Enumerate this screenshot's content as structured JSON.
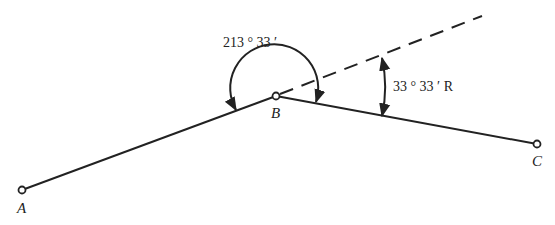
{
  "diagram": {
    "type": "traverse-deflection-angle",
    "points": [
      {
        "id": "A",
        "label": "A",
        "x": 22,
        "y": 190
      },
      {
        "id": "B",
        "label": "B",
        "x": 276,
        "y": 96
      },
      {
        "id": "C",
        "label": "C",
        "x": 537,
        "y": 144
      }
    ],
    "segments": [
      {
        "from": "A",
        "to": "B",
        "style": "solid"
      },
      {
        "from": "B",
        "to": "C",
        "style": "solid"
      },
      {
        "from": "B",
        "to": "extension",
        "style": "dashed",
        "note": "prolongation of line AB"
      }
    ],
    "angles": [
      {
        "name": "angle-to-right",
        "label": "213 ° 33 ′",
        "value_deg": 213,
        "value_min": 33,
        "at": "B"
      },
      {
        "name": "deflection-angle",
        "label": "33 ° 33 ′ R",
        "value_deg": 33,
        "value_min": 33,
        "direction": "R",
        "at": "B"
      }
    ]
  },
  "labels": {
    "A": "A",
    "B": "B",
    "C": "C",
    "angle_right": "213 ° 33 ′",
    "deflection": "33 ° 33 ′ R"
  },
  "colors": {
    "line": "#222222",
    "background": "#ffffff"
  }
}
